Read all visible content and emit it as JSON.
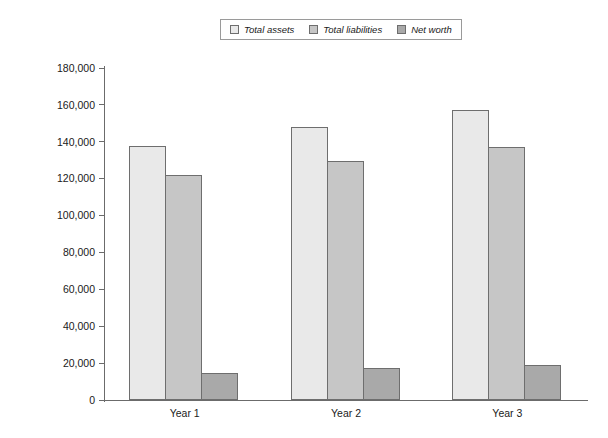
{
  "chart_data": {
    "type": "bar",
    "title": "",
    "subtitle": "",
    "xlabel": "",
    "ylabel": "",
    "categories": [
      "Year 1",
      "Year 2",
      "Year 3"
    ],
    "series": [
      {
        "name": "Total assets",
        "values": [
          137500,
          148000,
          157500
        ],
        "color": "#e9e9e9"
      },
      {
        "name": "Total liabilities",
        "values": [
          122000,
          129500,
          137000
        ],
        "color": "#c6c6c6"
      },
      {
        "name": "Net worth",
        "values": [
          14500,
          17500,
          19000
        ],
        "color": "#a9a9a9"
      }
    ],
    "ylim": [
      0,
      180000
    ],
    "ytick_values": [
      0,
      20000,
      40000,
      60000,
      80000,
      100000,
      120000,
      140000,
      160000,
      180000
    ],
    "ytick_labels": [
      "0",
      "20,000",
      "40,000",
      "60,000",
      "80,000",
      "100,000",
      "120,000",
      "140,000",
      "160,000",
      "180,000"
    ],
    "grid": false,
    "legend_position": "top-center",
    "legend_entries": [
      "Total assets",
      "Total liabilities",
      "Net worth"
    ],
    "axis_color": "#6b6b6b",
    "bar_border_color": "#6e6e6e",
    "background": "#ffffff"
  }
}
